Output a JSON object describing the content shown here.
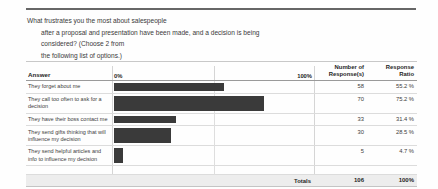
{
  "question": {
    "line1": "What frustrates you the most about salespeople",
    "line2": "after a proposal and presentation have been made, and a decision is being",
    "line3": "considered? (Choose 2 from",
    "line4": "the following list of options.)"
  },
  "table": {
    "headers": {
      "answer": "Answer",
      "scale_min": "0%",
      "scale_max": "100%",
      "number_of_responses": "Number of Response(s)",
      "response_ratio": "Response Ratio"
    },
    "totals_label": "Totals",
    "totals_responses": "106",
    "totals_ratio": "100%"
  },
  "chart_data": {
    "type": "bar",
    "title": "What frustrates you the most about salespeople after a proposal and presentation have been made, and a decision is being considered? (Choose 2 from the following list of options.)",
    "xlabel": "",
    "ylabel": "",
    "xlim": [
      0,
      100
    ],
    "grid": true,
    "legend": "none",
    "orientation": "horizontal",
    "tick_labels": [
      "0%",
      "100%"
    ],
    "categories": [
      "They forget about me",
      "They call too often to ask for a decision",
      "They have their boss contact me",
      "They send gifts thinking that will influence my decision",
      "They send helpful articles and info to influence my decision"
    ],
    "values": [
      55.2,
      75.2,
      31.4,
      28.5,
      4.7
    ],
    "counts": [
      58,
      70,
      33,
      30,
      5
    ],
    "ratios": [
      "55.2 %",
      "75.2 %",
      "31.4 %",
      "28.5 %",
      "4.7 %"
    ],
    "total_count": 106,
    "total_ratio": "100%",
    "bar_color": "#3a3a3a"
  }
}
